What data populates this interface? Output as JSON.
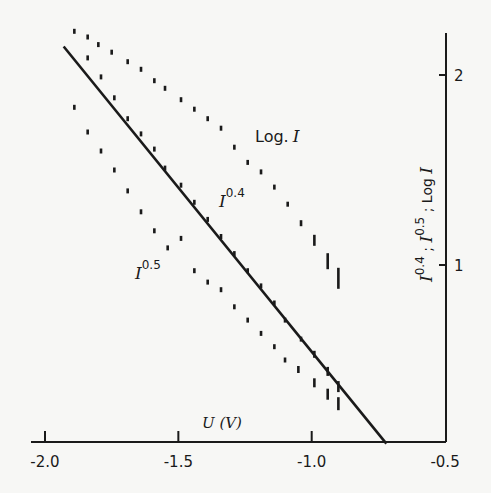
{
  "chart_data": {
    "type": "scatter",
    "title": "",
    "xlabel": "U (V)",
    "ylabel": "I^0.4 ; I^0.5 ; Log I",
    "xlim": [
      -2.07,
      -0.5
    ],
    "ylim": [
      0.07,
      2.22
    ],
    "x_ticks": [
      -2.0,
      -1.5,
      -1.0,
      -0.5
    ],
    "x_tick_labels": [
      "-2.0",
      "-1.5",
      "-1.0",
      "-0.5"
    ],
    "y_ticks": [
      1,
      2
    ],
    "y_tick_labels": [
      "1",
      "2"
    ],
    "y_axis_position": "right",
    "grid": false,
    "legend": "inline labels",
    "annotations": [
      {
        "text": "Log. I",
        "near_series": "Log I"
      },
      {
        "text": "I^0.4",
        "near_series": "I^0.4"
      },
      {
        "text": "I^0.5",
        "near_series": "I^0.5"
      }
    ],
    "series": [
      {
        "name": "Log I",
        "x": [
          -1.89,
          -1.84,
          -1.8,
          -1.75,
          -1.69,
          -1.64,
          -1.59,
          -1.55,
          -1.49,
          -1.44,
          -1.39,
          -1.34,
          -1.29,
          -1.24,
          -1.19,
          -1.14,
          -1.09,
          -1.04,
          -0.99,
          -0.94,
          -0.9
        ],
        "y": [
          2.23,
          2.2,
          2.16,
          2.12,
          2.07,
          2.03,
          1.97,
          1.93,
          1.87,
          1.82,
          1.77,
          1.72,
          1.62,
          1.54,
          1.49,
          1.41,
          1.32,
          1.22,
          1.13,
          1.02,
          0.93
        ]
      },
      {
        "name": "I^0.4",
        "x": [
          -1.84,
          -1.79,
          -1.74,
          -1.69,
          -1.64,
          -1.59,
          -1.55,
          -1.49,
          -1.44,
          -1.39,
          -1.34,
          -1.29,
          -1.24,
          -1.19,
          -1.14,
          -1.1,
          -1.04,
          -0.99,
          -0.94,
          -0.9
        ],
        "y": [
          2.09,
          1.99,
          1.88,
          1.77,
          1.69,
          1.61,
          1.51,
          1.42,
          1.33,
          1.24,
          1.15,
          1.06,
          0.97,
          0.89,
          0.8,
          0.71,
          0.61,
          0.53,
          0.44,
          0.36
        ]
      },
      {
        "name": "I^0.5",
        "x": [
          -1.89,
          -1.84,
          -1.79,
          -1.74,
          -1.69,
          -1.64,
          -1.59,
          -1.54,
          -1.49,
          -1.44,
          -1.39,
          -1.34,
          -1.29,
          -1.24,
          -1.19,
          -1.14,
          -1.1,
          -1.05,
          -0.99,
          -0.94,
          -0.9
        ],
        "y": [
          1.83,
          1.7,
          1.6,
          1.5,
          1.39,
          1.28,
          1.18,
          1.09,
          1.14,
          0.97,
          0.91,
          0.87,
          0.78,
          0.71,
          0.64,
          0.57,
          0.5,
          0.45,
          0.38,
          0.32,
          0.27
        ]
      },
      {
        "name": "fit line",
        "type": "line",
        "x": [
          -1.93,
          -0.72
        ],
        "y": [
          2.15,
          0.06
        ]
      }
    ]
  },
  "labels": {
    "x_axis_title": "U (V)",
    "y_axis_title_parts": [
      "I",
      "0.4",
      " ; ",
      "I",
      "0.5",
      " ; Log ",
      "I"
    ],
    "log_label": "Log.",
    "log_label_var": "I",
    "i04_base": "I",
    "i04_exp": "0.4",
    "i05_base": "I",
    "i05_exp": "0.5"
  }
}
